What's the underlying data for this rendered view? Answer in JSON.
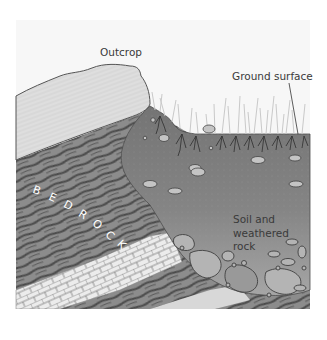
{
  "diagram": {
    "labels": {
      "outcrop": "Outcrop",
      "ground_surface": "Ground surface",
      "soil": "Soil and\nweathered\nrock",
      "bedrock": "BEDROCK"
    },
    "bedrock_letters": [
      "B",
      "E",
      "D",
      "R",
      "O",
      "C",
      "K"
    ],
    "colors": {
      "background": "#ffffff",
      "outcrop_fill": "#dcdcdc",
      "bedrock_fill": "#8a8a8a",
      "bedrock_stripe": "#4a4a4a",
      "soil_fill": "#7d7d7d",
      "soil_bottom": "#a8a8a8",
      "limestone_fill": "#e6e6e6",
      "pebble_fill": "#bdbdbd",
      "grass": "#c8c8c8",
      "roots": "#2e2e2e",
      "label_text": "#3a3a3a"
    }
  }
}
